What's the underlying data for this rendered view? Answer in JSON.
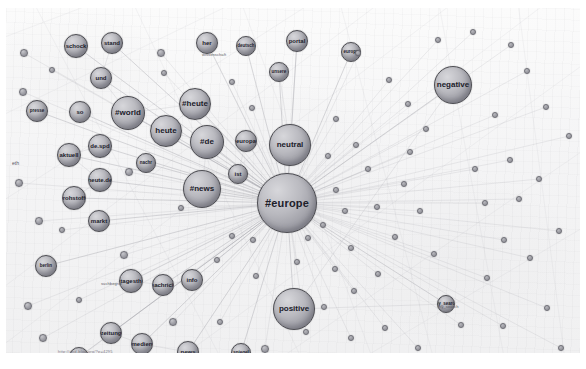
{
  "graph": {
    "title": "Twitter hashtag co-occurrence network",
    "background_color": "#f3f3f4",
    "node_fill": "#b9b9bf",
    "node_stroke": "#4c4c52",
    "edge_color": "#9a9aa2",
    "watermark": "http://dhd-blog.org/?p=4295",
    "left_edge_label": "eth",
    "edge_labels": [
      {
        "text": "my_search",
        "x": 432,
        "y": 296
      },
      {
        "text": "wissenschaft",
        "x": 196,
        "y": 44
      },
      {
        "text": "suchbegriff",
        "x": 95,
        "y": 273
      }
    ],
    "nodes": [
      {
        "label": "#europe",
        "x": 281,
        "y": 195,
        "r": 30,
        "cls": "hub"
      },
      {
        "label": "neutral",
        "x": 284,
        "y": 137,
        "r": 21,
        "cls": "big"
      },
      {
        "label": "positive",
        "x": 288,
        "y": 301,
        "r": 21,
        "cls": "big"
      },
      {
        "label": "negative",
        "x": 447,
        "y": 77,
        "r": 19,
        "cls": "big"
      },
      {
        "label": "#news",
        "x": 196,
        "y": 181,
        "r": 19,
        "cls": "big"
      },
      {
        "label": "#de",
        "x": 201,
        "y": 134,
        "r": 17,
        "cls": "big"
      },
      {
        "label": "heute",
        "x": 160,
        "y": 123,
        "r": 16,
        "cls": "big"
      },
      {
        "label": "#heute",
        "x": 189,
        "y": 96,
        "r": 16,
        "cls": "big"
      },
      {
        "label": "#world",
        "x": 122,
        "y": 105,
        "r": 17,
        "cls": "big"
      },
      {
        "label": "ist",
        "x": 232,
        "y": 166,
        "r": 10,
        "cls": "mid"
      },
      {
        "label": "europa",
        "x": 240,
        "y": 133,
        "r": 11,
        "cls": "mid"
      },
      {
        "label": "her",
        "x": 201,
        "y": 35,
        "r": 11,
        "cls": "mid"
      },
      {
        "label": "deutsch",
        "x": 240,
        "y": 38,
        "r": 10,
        "cls": "small"
      },
      {
        "label": "portal",
        "x": 291,
        "y": 33,
        "r": 11,
        "cls": "mid"
      },
      {
        "label": "unsere",
        "x": 273,
        "y": 64,
        "r": 10,
        "cls": "small"
      },
      {
        "label": "europa",
        "x": 345,
        "y": 44,
        "r": 10,
        "cls": "small"
      },
      {
        "label": "schock",
        "x": 70,
        "y": 38,
        "r": 12,
        "cls": "mid"
      },
      {
        "label": "stand",
        "x": 106,
        "y": 35,
        "r": 11,
        "cls": "mid"
      },
      {
        "label": "und",
        "x": 95,
        "y": 70,
        "r": 11,
        "cls": "mid"
      },
      {
        "label": "so",
        "x": 74,
        "y": 104,
        "r": 11,
        "cls": "mid"
      },
      {
        "label": "presse",
        "x": 31,
        "y": 103,
        "r": 11,
        "cls": "small"
      },
      {
        "label": "de.spd",
        "x": 94,
        "y": 138,
        "r": 12,
        "cls": "mid"
      },
      {
        "label": "aktuell",
        "x": 63,
        "y": 147,
        "r": 12,
        "cls": "mid"
      },
      {
        "label": "heute.de",
        "x": 94,
        "y": 172,
        "r": 12,
        "cls": "mid"
      },
      {
        "label": "rohstoff",
        "x": 68,
        "y": 190,
        "r": 12,
        "cls": "mid"
      },
      {
        "label": "markt",
        "x": 93,
        "y": 213,
        "r": 11,
        "cls": "mid"
      },
      {
        "label": "nachr",
        "x": 140,
        "y": 155,
        "r": 10,
        "cls": "small"
      },
      {
        "label": "berlin",
        "x": 40,
        "y": 258,
        "r": 11,
        "cls": "small"
      },
      {
        "label": "tagesth",
        "x": 125,
        "y": 273,
        "r": 12,
        "cls": "mid"
      },
      {
        "label": "nachrich",
        "x": 157,
        "y": 277,
        "r": 11,
        "cls": "mid"
      },
      {
        "label": "info",
        "x": 186,
        "y": 272,
        "r": 11,
        "cls": "mid"
      },
      {
        "label": "zeitung",
        "x": 105,
        "y": 325,
        "r": 11,
        "cls": "mid"
      },
      {
        "label": "medien",
        "x": 136,
        "y": 336,
        "r": 11,
        "cls": "mid"
      },
      {
        "label": "news",
        "x": 182,
        "y": 344,
        "r": 11,
        "cls": "mid"
      },
      {
        "label": "welt",
        "x": 73,
        "y": 349,
        "r": 10,
        "cls": "small"
      },
      {
        "label": "spiegel",
        "x": 235,
        "y": 345,
        "r": 10,
        "cls": "small"
      },
      {
        "label": "my_search",
        "x": 440,
        "y": 296,
        "r": 9,
        "cls": "small"
      },
      {
        "label": "",
        "x": 18,
        "y": 45,
        "r": 4,
        "cls": "dot"
      },
      {
        "label": "",
        "x": 17,
        "y": 84,
        "r": 4,
        "cls": "dot"
      },
      {
        "label": "",
        "x": 13,
        "y": 175,
        "r": 4,
        "cls": "dot"
      },
      {
        "label": "",
        "x": 33,
        "y": 213,
        "r": 4,
        "cls": "dot"
      },
      {
        "label": "",
        "x": 22,
        "y": 298,
        "r": 4,
        "cls": "dot"
      },
      {
        "label": "",
        "x": 37,
        "y": 330,
        "r": 4,
        "cls": "dot"
      },
      {
        "label": "",
        "x": 46,
        "y": 62,
        "r": 3,
        "cls": "dot"
      },
      {
        "label": "",
        "x": 123,
        "y": 164,
        "r": 4,
        "cls": "dot"
      },
      {
        "label": "",
        "x": 118,
        "y": 247,
        "r": 4,
        "cls": "dot"
      },
      {
        "label": "",
        "x": 73,
        "y": 292,
        "r": 3,
        "cls": "dot"
      },
      {
        "label": "",
        "x": 155,
        "y": 45,
        "r": 4,
        "cls": "dot"
      },
      {
        "label": "",
        "x": 158,
        "y": 65,
        "r": 3,
        "cls": "dot"
      },
      {
        "label": "",
        "x": 167,
        "y": 314,
        "r": 4,
        "cls": "dot"
      },
      {
        "label": "",
        "x": 211,
        "y": 252,
        "r": 3,
        "cls": "dot"
      },
      {
        "label": "",
        "x": 226,
        "y": 228,
        "r": 3,
        "cls": "dot"
      },
      {
        "label": "",
        "x": 247,
        "y": 232,
        "r": 3,
        "cls": "dot"
      },
      {
        "label": "",
        "x": 250,
        "y": 268,
        "r": 3,
        "cls": "dot"
      },
      {
        "label": "",
        "x": 259,
        "y": 341,
        "r": 4,
        "cls": "dot"
      },
      {
        "label": "",
        "x": 291,
        "y": 254,
        "r": 3,
        "cls": "dot"
      },
      {
        "label": "",
        "x": 302,
        "y": 230,
        "r": 3,
        "cls": "dot"
      },
      {
        "label": "",
        "x": 317,
        "y": 217,
        "r": 3,
        "cls": "dot"
      },
      {
        "label": "",
        "x": 330,
        "y": 182,
        "r": 3,
        "cls": "dot"
      },
      {
        "label": "",
        "x": 339,
        "y": 203,
        "r": 3,
        "cls": "dot"
      },
      {
        "label": "",
        "x": 345,
        "y": 240,
        "r": 3,
        "cls": "dot"
      },
      {
        "label": "",
        "x": 329,
        "y": 261,
        "r": 3,
        "cls": "dot"
      },
      {
        "label": "",
        "x": 348,
        "y": 283,
        "r": 3,
        "cls": "dot"
      },
      {
        "label": "",
        "x": 318,
        "y": 299,
        "r": 3,
        "cls": "dot"
      },
      {
        "label": "",
        "x": 300,
        "y": 324,
        "r": 3,
        "cls": "dot"
      },
      {
        "label": "",
        "x": 345,
        "y": 330,
        "r": 3,
        "cls": "dot"
      },
      {
        "label": "",
        "x": 379,
        "y": 320,
        "r": 3,
        "cls": "dot"
      },
      {
        "label": "",
        "x": 372,
        "y": 266,
        "r": 3,
        "cls": "dot"
      },
      {
        "label": "",
        "x": 389,
        "y": 229,
        "r": 3,
        "cls": "dot"
      },
      {
        "label": "",
        "x": 371,
        "y": 199,
        "r": 3,
        "cls": "dot"
      },
      {
        "label": "",
        "x": 362,
        "y": 161,
        "r": 3,
        "cls": "dot"
      },
      {
        "label": "",
        "x": 350,
        "y": 137,
        "r": 3,
        "cls": "dot"
      },
      {
        "label": "",
        "x": 330,
        "y": 111,
        "r": 3,
        "cls": "dot"
      },
      {
        "label": "",
        "x": 322,
        "y": 148,
        "r": 3,
        "cls": "dot"
      },
      {
        "label": "",
        "x": 398,
        "y": 176,
        "r": 3,
        "cls": "dot"
      },
      {
        "label": "",
        "x": 414,
        "y": 203,
        "r": 3,
        "cls": "dot"
      },
      {
        "label": "",
        "x": 428,
        "y": 246,
        "r": 3,
        "cls": "dot"
      },
      {
        "label": "",
        "x": 404,
        "y": 144,
        "r": 3,
        "cls": "dot"
      },
      {
        "label": "",
        "x": 420,
        "y": 121,
        "r": 3,
        "cls": "dot"
      },
      {
        "label": "",
        "x": 402,
        "y": 96,
        "r": 3,
        "cls": "dot"
      },
      {
        "label": "",
        "x": 383,
        "y": 72,
        "r": 3,
        "cls": "dot"
      },
      {
        "label": "",
        "x": 352,
        "y": 45,
        "r": 3,
        "cls": "dot"
      },
      {
        "label": "",
        "x": 432,
        "y": 32,
        "r": 3,
        "cls": "dot"
      },
      {
        "label": "",
        "x": 467,
        "y": 24,
        "r": 3,
        "cls": "dot"
      },
      {
        "label": "",
        "x": 505,
        "y": 37,
        "r": 3,
        "cls": "dot"
      },
      {
        "label": "",
        "x": 521,
        "y": 63,
        "r": 3,
        "cls": "dot"
      },
      {
        "label": "",
        "x": 540,
        "y": 99,
        "r": 3,
        "cls": "dot"
      },
      {
        "label": "",
        "x": 489,
        "y": 107,
        "r": 3,
        "cls": "dot"
      },
      {
        "label": "",
        "x": 504,
        "y": 152,
        "r": 3,
        "cls": "dot"
      },
      {
        "label": "",
        "x": 513,
        "y": 191,
        "r": 3,
        "cls": "dot"
      },
      {
        "label": "",
        "x": 533,
        "y": 171,
        "r": 3,
        "cls": "dot"
      },
      {
        "label": "",
        "x": 479,
        "y": 195,
        "r": 3,
        "cls": "dot"
      },
      {
        "label": "",
        "x": 469,
        "y": 161,
        "r": 3,
        "cls": "dot"
      },
      {
        "label": "",
        "x": 498,
        "y": 232,
        "r": 3,
        "cls": "dot"
      },
      {
        "label": "",
        "x": 524,
        "y": 250,
        "r": 3,
        "cls": "dot"
      },
      {
        "label": "",
        "x": 553,
        "y": 223,
        "r": 3,
        "cls": "dot"
      },
      {
        "label": "",
        "x": 481,
        "y": 270,
        "r": 3,
        "cls": "dot"
      },
      {
        "label": "",
        "x": 455,
        "y": 317,
        "r": 3,
        "cls": "dot"
      },
      {
        "label": "",
        "x": 497,
        "y": 318,
        "r": 3,
        "cls": "dot"
      },
      {
        "label": "",
        "x": 541,
        "y": 300,
        "r": 3,
        "cls": "dot"
      },
      {
        "label": "",
        "x": 555,
        "y": 340,
        "r": 3,
        "cls": "dot"
      },
      {
        "label": "",
        "x": 412,
        "y": 340,
        "r": 3,
        "cls": "dot"
      },
      {
        "label": "",
        "x": 563,
        "y": 128,
        "r": 3,
        "cls": "dot"
      },
      {
        "label": "",
        "x": 246,
        "y": 100,
        "r": 3,
        "cls": "dot"
      },
      {
        "label": "",
        "x": 226,
        "y": 74,
        "r": 3,
        "cls": "dot"
      },
      {
        "label": "",
        "x": 175,
        "y": 200,
        "r": 3,
        "cls": "dot"
      },
      {
        "label": "",
        "x": 56,
        "y": 222,
        "r": 3,
        "cls": "dot"
      },
      {
        "label": "",
        "x": 214,
        "y": 314,
        "r": 3,
        "cls": "dot"
      }
    ],
    "hub_index": 0,
    "spoke_targets": [
      1,
      2,
      3,
      4,
      5,
      6,
      7,
      8,
      9,
      10,
      11,
      12,
      13,
      14,
      15,
      16,
      17,
      18,
      19,
      20,
      21,
      22,
      23,
      24,
      25,
      26,
      27,
      28,
      29,
      30,
      31,
      32,
      33,
      34,
      35,
      36,
      37,
      38,
      39,
      40,
      41,
      42,
      43,
      44,
      45,
      46,
      47,
      48,
      49,
      50,
      51,
      52,
      53,
      54,
      55,
      56,
      57,
      58,
      59,
      60,
      61,
      62,
      63,
      64,
      65,
      66,
      67,
      68,
      69,
      70,
      71,
      72,
      73,
      74,
      75,
      76,
      77,
      78,
      79,
      80,
      81,
      82,
      83,
      84,
      85,
      86,
      87,
      88,
      89,
      90,
      91,
      92,
      93,
      94,
      95,
      96,
      97,
      98,
      99,
      100,
      101,
      102,
      103,
      104,
      105,
      106,
      107
    ],
    "extra_edges": [
      [
        1,
        13
      ],
      [
        1,
        14
      ],
      [
        4,
        5
      ],
      [
        5,
        6
      ],
      [
        6,
        7
      ],
      [
        7,
        8
      ],
      [
        8,
        18
      ],
      [
        18,
        17
      ],
      [
        21,
        22
      ],
      [
        22,
        23
      ],
      [
        23,
        24
      ],
      [
        28,
        29
      ],
      [
        29,
        30
      ],
      [
        31,
        32
      ],
      [
        32,
        33
      ],
      [
        3,
        2
      ],
      [
        9,
        10
      ],
      [
        2,
        36
      ]
    ],
    "background_lines": [
      [
        -30,
        120,
        300,
        -40
      ],
      [
        -30,
        210,
        360,
        -40
      ],
      [
        -30,
        300,
        420,
        -40
      ],
      [
        -20,
        350,
        480,
        -30
      ],
      [
        60,
        360,
        560,
        -20
      ],
      [
        160,
        360,
        600,
        40
      ],
      [
        260,
        360,
        610,
        120
      ],
      [
        -30,
        40,
        180,
        -40
      ],
      [
        340,
        360,
        610,
        200
      ],
      [
        20,
        -20,
        220,
        360
      ],
      [
        120,
        -20,
        300,
        360
      ],
      [
        230,
        -20,
        370,
        360
      ],
      [
        330,
        -20,
        430,
        360
      ],
      [
        430,
        -20,
        500,
        360
      ],
      [
        510,
        -20,
        560,
        360
      ]
    ]
  }
}
